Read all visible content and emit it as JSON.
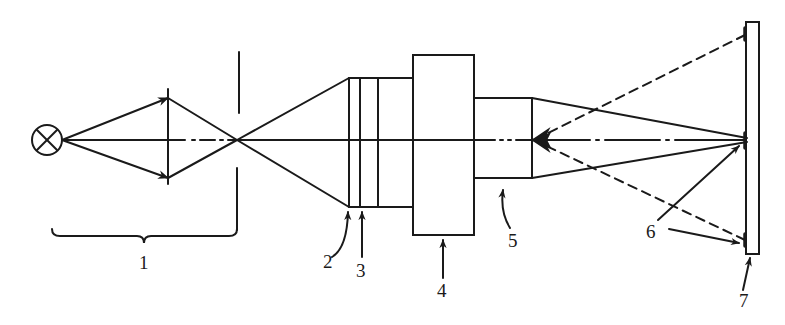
{
  "diagram": {
    "type": "optical-schematic",
    "stroke_color": "#1a1a1a",
    "background": "#ffffff",
    "labels": [
      {
        "id": "1",
        "text": "1",
        "refers_to": "illumination section (light source, condenser lens, aperture)"
      },
      {
        "id": "2",
        "text": "2",
        "refers_to": "first plate / lens surface"
      },
      {
        "id": "3",
        "text": "3",
        "refers_to": "second plate"
      },
      {
        "id": "4",
        "text": "4",
        "refers_to": "large rectangular block"
      },
      {
        "id": "5",
        "text": "5",
        "refers_to": "objective tube"
      },
      {
        "id": "6",
        "text": "6",
        "refers_to": "reference marks on target"
      },
      {
        "id": "7",
        "text": "7",
        "refers_to": "target plate"
      }
    ]
  }
}
